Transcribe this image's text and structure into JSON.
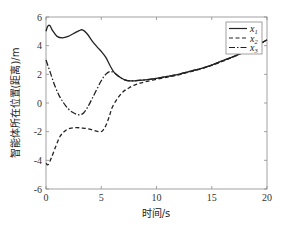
{
  "chart_data": {
    "type": "line",
    "title": "",
    "xlabel": "时间/s",
    "ylabel": "智能体所在位置(距离)/m",
    "xlim": [
      0,
      20
    ],
    "ylim": [
      -6,
      6
    ],
    "xticks": [
      0,
      5,
      10,
      15,
      20
    ],
    "yticks": [
      -6,
      -4,
      -2,
      0,
      2,
      4,
      6
    ],
    "grid": false,
    "legend_position": "upper right",
    "series": [
      {
        "name": "x1",
        "label_main": "x",
        "label_sub": "1",
        "style": "solid",
        "x": [
          0,
          0.15,
          0.35,
          0.6,
          1.0,
          1.5,
          2.0,
          2.5,
          3.0,
          3.3,
          3.7,
          4.2,
          4.7,
          5.0,
          5.4,
          5.8,
          6.2,
          6.7,
          7.2,
          7.6,
          8.0,
          9.0,
          10,
          11,
          12,
          13,
          14,
          15,
          16,
          17,
          18,
          19,
          19.5,
          20
        ],
        "y": [
          5.0,
          5.35,
          5.4,
          5.05,
          4.65,
          4.55,
          4.65,
          4.85,
          5.05,
          5.1,
          4.85,
          4.3,
          3.85,
          3.6,
          3.2,
          2.6,
          2.1,
          1.8,
          1.6,
          1.55,
          1.55,
          1.62,
          1.72,
          1.85,
          2.0,
          2.2,
          2.4,
          2.65,
          2.95,
          3.25,
          3.6,
          4.0,
          4.2,
          4.4
        ]
      },
      {
        "name": "x2",
        "label_main": "x",
        "label_sub": "2",
        "style": "dashed",
        "x": [
          0,
          0.2,
          0.5,
          0.9,
          1.3,
          1.8,
          2.3,
          2.8,
          3.3,
          3.8,
          4.3,
          4.8,
          5.1,
          5.4,
          5.7,
          6.0,
          6.5,
          7.0,
          7.5,
          8.0,
          8.5,
          9.0,
          10,
          11,
          12,
          13,
          14,
          15,
          16,
          17,
          18,
          19,
          19.5,
          20
        ],
        "y": [
          -4.2,
          -4.3,
          -3.8,
          -3.0,
          -2.3,
          -1.9,
          -1.75,
          -1.72,
          -1.75,
          -1.8,
          -1.9,
          -2.0,
          -1.95,
          -1.6,
          -1.0,
          -0.3,
          0.35,
          0.8,
          1.05,
          1.25,
          1.38,
          1.48,
          1.65,
          1.8,
          1.97,
          2.17,
          2.38,
          2.62,
          2.92,
          3.23,
          3.58,
          3.98,
          4.18,
          4.4
        ]
      },
      {
        "name": "x3",
        "label_main": "x",
        "label_sub": "3",
        "style": "dash-dot",
        "x": [
          0,
          0.4,
          0.8,
          1.2,
          1.6,
          2.0,
          2.4,
          2.8,
          3.1,
          3.4,
          3.8,
          4.2,
          4.6,
          5.0,
          5.4,
          5.8,
          6.2,
          6.6,
          7.0,
          7.4,
          8.0,
          9.0,
          10,
          11,
          12,
          13,
          14,
          15,
          16,
          17,
          18,
          19,
          19.5,
          20
        ],
        "y": [
          3.0,
          2.1,
          1.2,
          0.5,
          0.0,
          -0.4,
          -0.65,
          -0.8,
          -0.82,
          -0.7,
          -0.25,
          0.35,
          0.95,
          1.55,
          2.0,
          2.2,
          2.1,
          1.85,
          1.65,
          1.56,
          1.55,
          1.62,
          1.72,
          1.85,
          2.0,
          2.2,
          2.4,
          2.65,
          2.95,
          3.25,
          3.6,
          4.0,
          4.2,
          4.4
        ]
      }
    ]
  },
  "colors": {
    "axis": "#8a8a8a",
    "line": "#222222",
    "background": "#ffffff"
  }
}
